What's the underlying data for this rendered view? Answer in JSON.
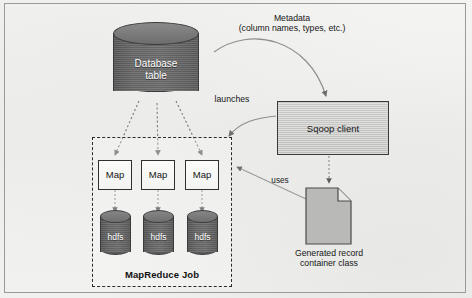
{
  "diagram": {
    "database": {
      "label": "Database\ntable",
      "shape": "cylinder"
    },
    "sqoop": {
      "label": "Sqoop client",
      "shape": "rectangle"
    },
    "document": {
      "label": "Generated record\ncontainer class",
      "shape": "document-page"
    },
    "mapreduce": {
      "label": "MapReduce Job",
      "maps": [
        {
          "label": "Map"
        },
        {
          "label": "Map"
        },
        {
          "label": "Map"
        }
      ],
      "stores": [
        {
          "label": "hdfs"
        },
        {
          "label": "hdfs"
        },
        {
          "label": "hdfs"
        }
      ]
    },
    "edges": {
      "metadata": "Metadata\n(column names, types, etc.)",
      "launches": "launches",
      "uses": "uses"
    },
    "colors": {
      "page_background": "#f2f2f0",
      "frame_border": "#9a9a9a",
      "cylinder_fill": "#6e6e6e",
      "cylinder_stroke": "#3a3a3a",
      "map_box_fill": "#f9f9f7",
      "map_box_stroke": "#2f2f2f",
      "sqoop_fill": "#cecece",
      "document_fill": "#b9b9b7",
      "dashed_box_stroke": "#2b2b2b",
      "arrow_color": "#6f6f6f",
      "text_color": "#161616",
      "inverse_text_color": "#ffffff"
    }
  }
}
